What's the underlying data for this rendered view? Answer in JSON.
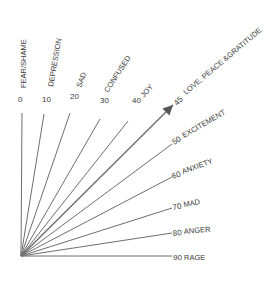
{
  "diagram": {
    "type": "emotional-scale-fan",
    "origin": {
      "x": 21,
      "y": 256
    },
    "line_color": "#6e6e6e",
    "text_color": "#3a3a3a",
    "rays": [
      {
        "value": "0",
        "label": "FEAR/SHAME",
        "end": {
          "x": 22,
          "y": 113
        },
        "num": {
          "x": 18,
          "y": 102,
          "rot": 0
        },
        "lab": {
          "x": 26,
          "y": 88,
          "rot": -90
        }
      },
      {
        "value": "10",
        "label": "DEPRESSION",
        "end": {
          "x": 44,
          "y": 114
        },
        "num": {
          "x": 42,
          "y": 102,
          "rot": 0
        },
        "lab": {
          "x": 53,
          "y": 87,
          "rot": -80
        }
      },
      {
        "value": "20",
        "label": "SAD",
        "end": {
          "x": 70,
          "y": 113
        },
        "num": {
          "x": 70,
          "y": 99,
          "rot": 0
        },
        "lab": {
          "x": 81,
          "y": 88,
          "rot": -70
        }
      },
      {
        "value": "30",
        "label": "CONFUSED",
        "end": {
          "x": 100,
          "y": 119
        },
        "num": {
          "x": 100,
          "y": 103,
          "rot": 0
        },
        "lab": {
          "x": 108,
          "y": 93,
          "rot": -57
        }
      },
      {
        "value": "40",
        "label": "JOY",
        "end": {
          "x": 128,
          "y": 121
        },
        "num": {
          "x": 132,
          "y": 103,
          "rot": 0
        },
        "lab": {
          "x": 144,
          "y": 98,
          "rot": -50
        }
      },
      {
        "value": "45",
        "label": "LOVE, PEACE &GRATITUDE",
        "end": {
          "x": 173,
          "y": 105
        },
        "num": {
          "x": 177,
          "y": 106,
          "rot": -45
        },
        "lab": {
          "x": 186,
          "y": 95,
          "rot": -40
        },
        "arrow": true
      },
      {
        "value": "50",
        "label": "EXCITEMENT",
        "end": {
          "x": 172,
          "y": 144
        },
        "num": {
          "x": 174,
          "y": 145,
          "rot": -30
        },
        "lab": {
          "x": 184,
          "y": 138,
          "rot": -30
        }
      },
      {
        "value": "60",
        "label": "ANXIETY",
        "end": {
          "x": 172,
          "y": 177
        },
        "num": {
          "x": 173,
          "y": 179,
          "rot": -20
        },
        "lab": {
          "x": 183,
          "y": 174,
          "rot": -20
        }
      },
      {
        "value": "70",
        "label": "MAD",
        "end": {
          "x": 172,
          "y": 208
        },
        "num": {
          "x": 173,
          "y": 210,
          "rot": -10
        },
        "lab": {
          "x": 184,
          "y": 207,
          "rot": -10
        }
      },
      {
        "value": "80",
        "label": "ANGER",
        "end": {
          "x": 172,
          "y": 233
        },
        "num": {
          "x": 173,
          "y": 236,
          "rot": -5
        },
        "lab": {
          "x": 184,
          "y": 234,
          "rot": -5
        }
      },
      {
        "value": "90",
        "label": "RAGE",
        "end": {
          "x": 172,
          "y": 256
        },
        "num": {
          "x": 173,
          "y": 260,
          "rot": 0
        },
        "lab": {
          "x": 184,
          "y": 260,
          "rot": 0
        }
      }
    ]
  }
}
